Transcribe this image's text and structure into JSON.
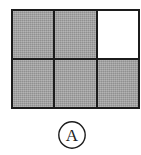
{
  "figure": {
    "label": "A",
    "label_style": "circled",
    "colors": {
      "fill": "#9e9e9e",
      "empty": "#ffffff",
      "stroke": "#1c1c1c",
      "background": "#ffffff"
    },
    "grid": {
      "columns": 3,
      "rows": 2,
      "cell_count": 6,
      "filled_count": 5,
      "empty_count": 1,
      "cells": [
        {
          "row": 0,
          "col": 0,
          "state": "filled"
        },
        {
          "row": 0,
          "col": 1,
          "state": "filled"
        },
        {
          "row": 0,
          "col": 2,
          "state": "empty"
        },
        {
          "row": 1,
          "col": 0,
          "state": "filled"
        },
        {
          "row": 1,
          "col": 1,
          "state": "filled"
        },
        {
          "row": 1,
          "col": 2,
          "state": "filled"
        }
      ]
    }
  }
}
